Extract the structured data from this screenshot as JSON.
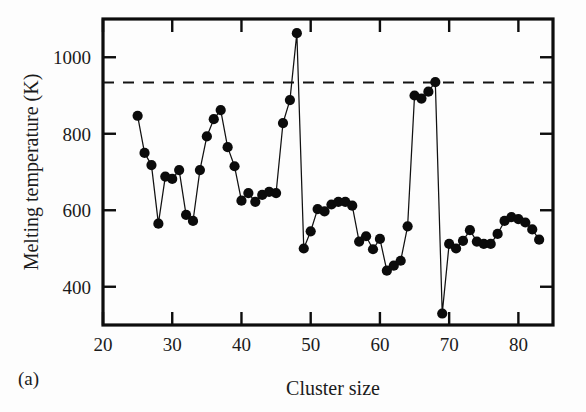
{
  "figure": {
    "panel_letter": "(a)",
    "background_color": "#fdfdfd",
    "ink_color": "#111111"
  },
  "axes": {
    "x_title": "Cluster size",
    "y_title": "Melting temperature (K)",
    "x_ticks": [
      "20",
      "30",
      "40",
      "50",
      "60",
      "70",
      "80"
    ],
    "y_ticks": [
      "400",
      "600",
      "800",
      "1000"
    ]
  },
  "chart_data": {
    "type": "line",
    "title": "",
    "xlabel": "Cluster size",
    "ylabel": "Melting temperature (K)",
    "xlim": [
      20,
      85
    ],
    "ylim": [
      300,
      1100
    ],
    "xticks": [
      20,
      30,
      40,
      50,
      60,
      70,
      80
    ],
    "yticks": [
      400,
      600,
      800,
      1000
    ],
    "grid": false,
    "legend": "none",
    "marker": "filled-circle",
    "annotations": [
      {
        "type": "hline",
        "label": "bulk melting temperature",
        "value": 934,
        "style": "dashed"
      },
      {
        "type": "text",
        "label": "(a)",
        "position": "below-left"
      }
    ],
    "series": [
      {
        "name": "Melting temperature vs cluster size",
        "x": [
          25,
          26,
          27,
          28,
          29,
          30,
          31,
          32,
          33,
          34,
          35,
          36,
          37,
          38,
          39,
          40,
          41,
          42,
          43,
          44,
          45,
          46,
          47,
          48,
          49,
          50,
          51,
          52,
          53,
          54,
          55,
          56,
          57,
          58,
          59,
          60,
          61,
          62,
          63,
          64,
          65,
          66,
          67,
          68,
          69,
          70,
          71,
          72,
          73,
          74,
          75,
          76,
          77,
          78,
          79,
          80,
          81,
          82,
          83
        ],
        "values": [
          847,
          750,
          718,
          565,
          688,
          682,
          705,
          588,
          572,
          705,
          793,
          838,
          862,
          765,
          715,
          625,
          645,
          622,
          640,
          648,
          645,
          828,
          888,
          1063,
          500,
          545,
          603,
          597,
          615,
          622,
          622,
          612,
          518,
          532,
          498,
          525,
          442,
          455,
          468,
          558,
          900,
          892,
          910,
          935,
          330,
          512,
          500,
          520,
          548,
          518,
          512,
          512,
          538,
          572,
          582,
          577,
          568,
          550,
          523
        ]
      }
    ]
  }
}
